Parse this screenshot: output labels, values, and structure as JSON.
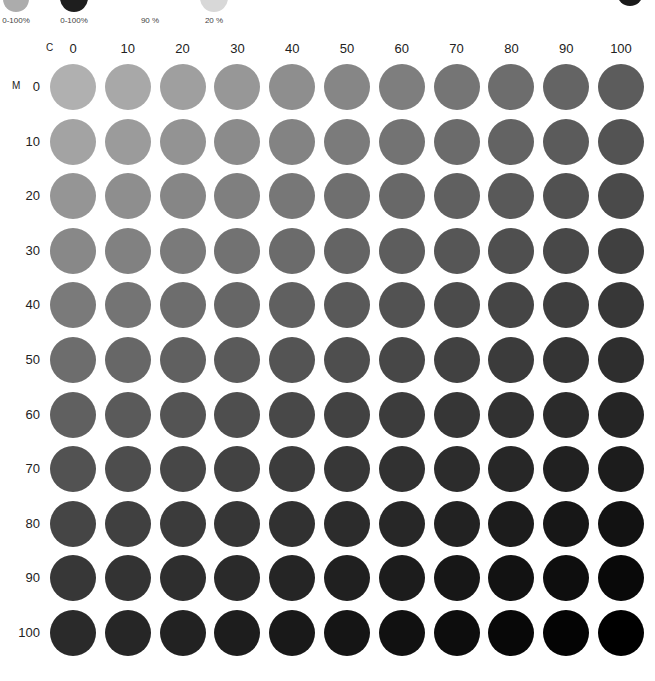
{
  "legend": [
    {
      "label": "0-100%",
      "color": "#acacac",
      "x": 3,
      "size": 26
    },
    {
      "label": "0-100%",
      "color": "#1e1e1e",
      "x": 60,
      "size": 28
    },
    {
      "label": "90 %",
      "color": null,
      "x": 143,
      "size": 0
    },
    {
      "label": "20 %",
      "color": "#d8d8d8",
      "x": 200,
      "size": 28
    }
  ],
  "corner_dot": {
    "color": "#1a1a1a"
  },
  "axes": {
    "column_axis": "C",
    "row_axis": "M"
  },
  "columns": [
    "0",
    "10",
    "20",
    "30",
    "40",
    "50",
    "60",
    "70",
    "80",
    "90",
    "100"
  ],
  "rows": [
    "0",
    "10",
    "20",
    "30",
    "40",
    "50",
    "60",
    "70",
    "80",
    "90",
    "100"
  ],
  "chart_data": {
    "type": "heatmap",
    "title": "",
    "xlabel": "C",
    "ylabel": "M",
    "x": [
      0,
      10,
      20,
      30,
      40,
      50,
      60,
      70,
      80,
      90,
      100
    ],
    "y": [
      0,
      10,
      20,
      30,
      40,
      50,
      60,
      70,
      80,
      90,
      100
    ],
    "note": "Grid of circular swatches; gray value darkens with increasing C (left→right) and M (top→bottom). Top-left ≈ #b0b0b0, top-right ≈ #5c5c5c, bottom-left ≈ #2a2a2a, bottom-right ≈ #000000."
  }
}
